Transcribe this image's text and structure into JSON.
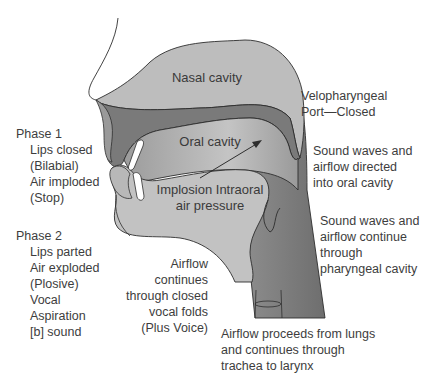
{
  "diagram": {
    "colors": {
      "background": "#ffffff",
      "nasal_cavity": "#bdbdbd",
      "palate_dark": "#7a7a7a",
      "oral_cavity": "#a9a9a9",
      "tongue": "#c2c2c2",
      "pharynx": "#8a8a8a",
      "teeth": "#ffffff",
      "outline": "#2e2e2e",
      "text": "#3d3d3d"
    },
    "region_labels": {
      "nasal_cavity": "Nasal cavity",
      "oral_cavity": "Oral cavity",
      "implosion_line1": "Implosion Intraoral",
      "implosion_line2": "air pressure"
    },
    "annotations": {
      "velopharyngeal": [
        "Velopharyngeal",
        "Port—Closed"
      ],
      "sound_oral": [
        "Sound waves and",
        "airflow directed",
        "into oral cavity"
      ],
      "sound_pharyngeal": [
        "Sound waves and",
        "airflow continue",
        "through",
        "pharyngeal cavity"
      ],
      "airflow_folds": [
        "Airflow",
        "continues",
        "through closed",
        "vocal folds",
        "(Plus Voice)"
      ],
      "airflow_lungs": [
        "Airflow proceeds from lungs",
        "and continues through",
        "trachea to larynx"
      ]
    },
    "phases": [
      {
        "heading": "Phase 1",
        "items": [
          "Lips closed",
          "(Bilabial)",
          "Air imploded",
          "(Stop)"
        ]
      },
      {
        "heading": "Phase 2",
        "items": [
          "Lips parted",
          "Air exploded",
          "(Plosive)",
          "Vocal",
          "Aspiration",
          "[b] sound"
        ]
      }
    ],
    "arrow": {
      "label": "airflow-direction-arrow",
      "from": [
        200,
        178
      ],
      "to": [
        262,
        140
      ]
    }
  }
}
